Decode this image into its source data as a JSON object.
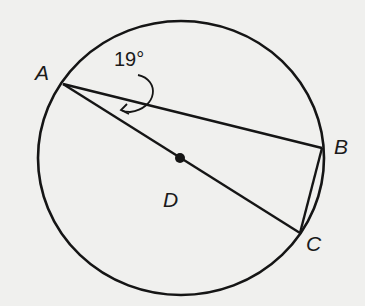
{
  "diagram": {
    "type": "circle-geometry",
    "points": {
      "A": {
        "label": "A",
        "x": 63,
        "y": 84
      },
      "B": {
        "label": "B",
        "x": 322,
        "y": 148
      },
      "C": {
        "label": "C",
        "x": 300,
        "y": 233
      },
      "D": {
        "label": "D",
        "x": 180,
        "y": 158
      }
    },
    "circle": {
      "cx": 181,
      "cy": 158,
      "rx": 143,
      "ry": 137,
      "center_label": "D"
    },
    "segments": [
      {
        "from": "A",
        "to": "B"
      },
      {
        "from": "A",
        "to": "C",
        "note": "diameter through center D"
      },
      {
        "from": "B",
        "to": "C"
      }
    ],
    "angle_annotation": {
      "text": "19°",
      "vertex": "A",
      "between": [
        "AB",
        "AC"
      ]
    },
    "colors": {
      "stroke": "#151515",
      "background": "#f0f0ee"
    }
  }
}
